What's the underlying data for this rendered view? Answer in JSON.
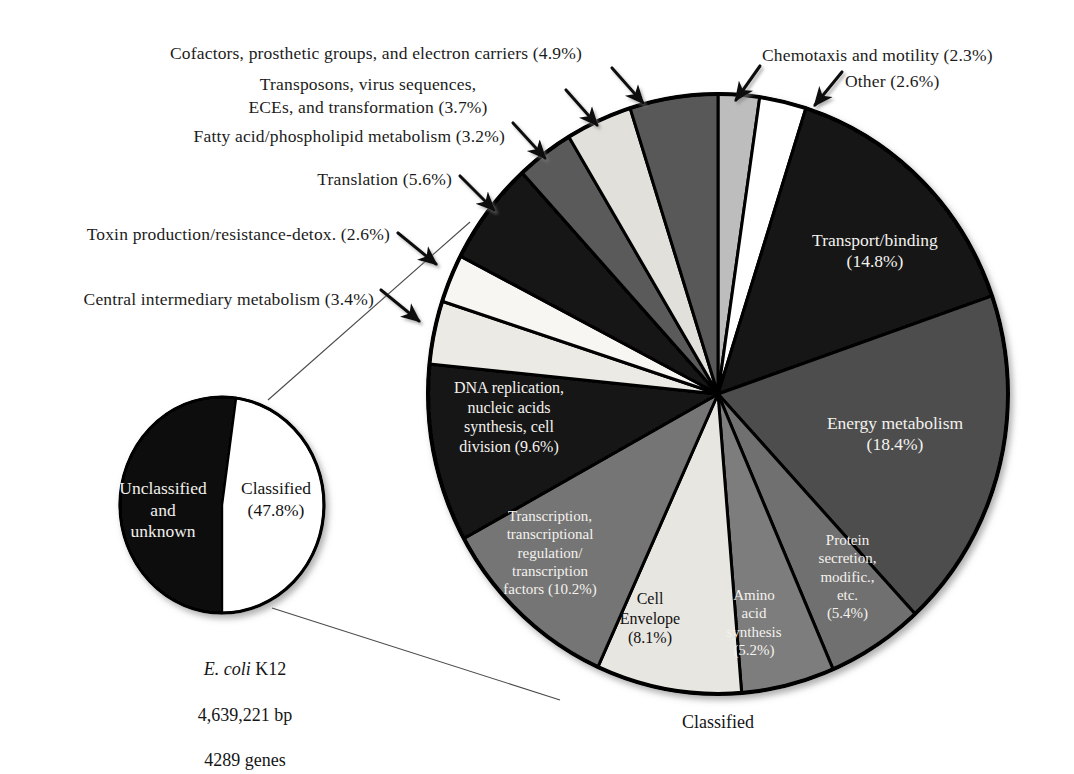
{
  "figure": {
    "bottom_label": "Classified"
  },
  "caption": {
    "organism": "E. coli",
    "strain": " K12",
    "bp": "4,639,221 bp",
    "genes": "4289 genes"
  },
  "colors": {
    "black": "#111111",
    "dark_gray": "#4e4e4e",
    "mid_dark_gray": "#5a5a5a",
    "mid_gray": "#7d7d7d",
    "light_gray": "#bdbdbd",
    "pale_gray": "#e3e1dc",
    "near_white": "#f2f1ed",
    "white": "#ffffff",
    "outline": "#000000",
    "text_dark": "#1c1c1c",
    "text_light": "#f4f2ee"
  },
  "small_pie": {
    "title": "E. coli K12 classified vs unclassified genes",
    "type": "pie",
    "slices": [
      {
        "label": "Unclassified\nand\nunknown",
        "value": 52.2,
        "color": "#111111",
        "text_color": "light"
      },
      {
        "label": "Classified\n(47.8%)",
        "value": 47.8,
        "color": "#ffffff",
        "text_color": "dark"
      }
    ]
  },
  "callouts": [
    {
      "id": "cofactors",
      "text": "Cofactors, prosthetic groups, and  electron carriers (4.9%)",
      "align": "center"
    },
    {
      "id": "transposons",
      "text": "Transposons, virus sequences,\nECEs, and transformation (3.7%)",
      "align": "center"
    },
    {
      "id": "fatty-acid",
      "text": "Fatty acid/phospholipid metabolism (3.2%)",
      "align": "right"
    },
    {
      "id": "translation",
      "text": "Translation (5.6%)",
      "align": "right"
    },
    {
      "id": "toxin",
      "text": "Toxin production/resistance-detox. (2.6%)",
      "align": "right"
    },
    {
      "id": "central-intermediary",
      "text": "Central intermediary metabolism (3.4%)",
      "align": "right"
    },
    {
      "id": "chemotaxis",
      "text": "Chemotaxis and motility (2.3%)",
      "align": "left"
    },
    {
      "id": "other",
      "text": "Other (2.6%)",
      "align": "left"
    }
  ],
  "chart_data": {
    "type": "pie",
    "subtitle": "Percentages of classified genes",
    "center_x": 718,
    "center_y": 394,
    "radius_x": 290,
    "radius_y": 300,
    "start_angle_deg": -90,
    "direction": "clockwise",
    "legend": "none",
    "units": "% of classified genes",
    "categories": [
      "Chemotaxis and motility",
      "Other",
      "Transport/binding",
      "Energy metabolism",
      "Protein secretion, modific., etc.",
      "Amino acid synthesis",
      "Cell Envelope",
      "Transcription, transcriptional regulation/transcription factors",
      "DNA replication, nucleic acids synthesis, cell division",
      "Central intermediary metabolism",
      "Toxin production/resistance-detox.",
      "Translation",
      "Fatty acid/phospholipid metabolism",
      "Transposons, virus sequences, ECEs, and transformation",
      "Cofactors, prosthetic groups, and electron carriers"
    ],
    "values": [
      2.3,
      2.6,
      14.8,
      18.4,
      5.4,
      5.2,
      8.1,
      10.2,
      9.6,
      3.4,
      2.6,
      5.6,
      3.2,
      3.7,
      4.9
    ],
    "slices": [
      {
        "key": "chemotaxis",
        "label": "Chemotaxis and motility",
        "value": 2.3,
        "color": "#bdbdbd",
        "label_in_slice": false
      },
      {
        "key": "other",
        "label": "Other",
        "value": 2.6,
        "color": "#ffffff",
        "label_in_slice": false
      },
      {
        "key": "transport",
        "label": "Transport/binding\n(14.8%)",
        "value": 14.8,
        "color": "#131313",
        "label_in_slice": true,
        "text_color": "light"
      },
      {
        "key": "energy",
        "label": "Energy metabolism\n(18.4%)",
        "value": 18.4,
        "color": "#4e4e4e",
        "label_in_slice": true,
        "text_color": "light"
      },
      {
        "key": "protein-secretion",
        "label": "Protein\nsecretion,\nmodific.,\netc.\n(5.4%)",
        "value": 5.4,
        "color": "#6f6f6f",
        "label_in_slice": true,
        "text_color": "light"
      },
      {
        "key": "amino-acid",
        "label": "Amino\nacid\nsynthesis\n(5.2%)",
        "value": 5.2,
        "color": "#7d7d7d",
        "label_in_slice": true,
        "text_color": "light"
      },
      {
        "key": "cell-envelope",
        "label": "Cell\nEnvelope\n(8.1%)",
        "value": 8.1,
        "color": "#e8e6e1",
        "label_in_slice": true,
        "text_color": "dark"
      },
      {
        "key": "transcription",
        "label": "Transcription,\ntranscriptional\nregulation/\ntranscription\nfactors (10.2%)",
        "value": 10.2,
        "color": "#757575",
        "label_in_slice": true,
        "text_color": "light"
      },
      {
        "key": "dna-replication",
        "label": "DNA replication,\nnucleic acids\nsynthesis, cell\ndivision (9.6%)",
        "value": 9.6,
        "color": "#131313",
        "label_in_slice": true,
        "text_color": "light"
      },
      {
        "key": "central-intermediary",
        "label": "Central intermediary metabolism",
        "value": 3.4,
        "color": "#eceae5",
        "label_in_slice": false
      },
      {
        "key": "toxin",
        "label": "Toxin production/resistance-detox.",
        "value": 2.6,
        "color": "#f7f6f3",
        "label_in_slice": false
      },
      {
        "key": "translation",
        "label": "Translation",
        "value": 5.6,
        "color": "#131313",
        "label_in_slice": false
      },
      {
        "key": "fatty-acid",
        "label": "Fatty acid/phospholipid metabolism",
        "value": 3.2,
        "color": "#5a5a5a",
        "label_in_slice": false
      },
      {
        "key": "transposons",
        "label": "Transposons, virus sequences, ECEs, and transformation",
        "value": 3.7,
        "color": "#e2e0db",
        "label_in_slice": false
      },
      {
        "key": "cofactors",
        "label": "Cofactors, prosthetic groups, and electron carriers",
        "value": 4.9,
        "color": "#585858",
        "label_in_slice": false
      }
    ]
  }
}
